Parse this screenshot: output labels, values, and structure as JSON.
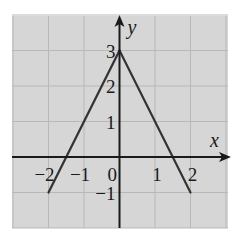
{
  "chart_data": {
    "type": "line",
    "title": "",
    "xlabel": "x",
    "ylabel": "y",
    "xlim": [
      -3,
      3
    ],
    "ylim": [
      -2,
      4
    ],
    "grid": true,
    "x_ticks": [
      {
        "value": -2,
        "label": "−2"
      },
      {
        "value": -1,
        "label": "−1"
      },
      {
        "value": 0,
        "label": "0"
      },
      {
        "value": 1,
        "label": "1"
      },
      {
        "value": 2,
        "label": "2"
      }
    ],
    "y_ticks": [
      {
        "value": 3,
        "label": "3"
      },
      {
        "value": 2,
        "label": "2"
      },
      {
        "value": 1,
        "label": "1"
      },
      {
        "value": -1,
        "label": "−1"
      }
    ],
    "series": [
      {
        "name": "left-segment",
        "x": [
          -2,
          0
        ],
        "y": [
          -1,
          3
        ]
      },
      {
        "name": "right-segment",
        "x": [
          0,
          2
        ],
        "y": [
          3,
          -1
        ]
      }
    ],
    "colors": {
      "background": "#d6d6d6",
      "grid": "#b8b8b8",
      "axis": "#1a1a1a",
      "line": "#333333"
    }
  }
}
